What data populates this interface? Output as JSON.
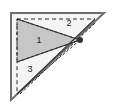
{
  "figure": {
    "name": "right-triangle-subdivision-diagram",
    "canvas": {
      "width": 117,
      "height": 109
    },
    "background_color": "#ffffff",
    "colors": {
      "outline": "#6e6e6e",
      "inner_line": "#3a3a3a",
      "dashed_line": "#2b2b2b",
      "shaded_fill": "#c6c6c6",
      "plain_fill": "#f4f4f4",
      "label_text": "#1a1a1a",
      "vertex_dot": "#333333"
    },
    "outer_triangle": {
      "label": "outer-right-triangle",
      "vertices": [
        {
          "name": "top-left",
          "x": 11,
          "y": 13
        },
        {
          "name": "top-right",
          "x": 104,
          "y": 13
        },
        {
          "name": "bottom-left",
          "x": 11,
          "y": 100
        }
      ],
      "stroke": "#6e6e6e",
      "stroke_width": 2,
      "fill": "#f4f4f4"
    },
    "inner_dashed_triangle": {
      "label": "inner-dashed-triangle",
      "vertices": [
        {
          "name": "top-left",
          "x": 17,
          "y": 19
        },
        {
          "name": "top-right",
          "x": 95,
          "y": 19
        },
        {
          "name": "bottom-left",
          "x": 17,
          "y": 94
        }
      ],
      "stroke": "#2b2b2b",
      "dash": "4 3"
    },
    "shaded_region": {
      "label": "shaded-triangle-region-1",
      "vertices": [
        {
          "name": "apex-left-top",
          "x": 17,
          "y": 19
        },
        {
          "name": "apex-right",
          "x": 80,
          "y": 40
        },
        {
          "name": "apex-left-bottom",
          "x": 17,
          "y": 62
        }
      ],
      "fill": "#c6c6c6",
      "stroke": "#2b2b2b",
      "dash": "3 2"
    },
    "fold_lines": [
      {
        "name": "fold-line-to-vertex-upper",
        "x1": 17,
        "y1": 19,
        "x2": 80,
        "y2": 40,
        "style": "solid"
      },
      {
        "name": "fold-line-to-vertex-lower",
        "x1": 17,
        "y1": 62,
        "x2": 80,
        "y2": 40,
        "style": "solid"
      },
      {
        "name": "fold-line-hypotenuse-inner",
        "x1": 17,
        "y1": 94,
        "x2": 95,
        "y2": 19,
        "style": "solid"
      },
      {
        "name": "fold-line-hypotenuse-dashed",
        "x1": 20,
        "y1": 94,
        "x2": 95,
        "y2": 23,
        "style": "dashed"
      },
      {
        "name": "fold-line-crease-to-vertex",
        "x1": 17,
        "y1": 94,
        "x2": 80,
        "y2": 40,
        "style": "dashed"
      }
    ],
    "vertex_marker": {
      "name": "convergence-vertex-dot",
      "x": 80,
      "y": 40,
      "r": 3
    },
    "labels": [
      {
        "name": "region-label-1",
        "text": "1",
        "x": 39,
        "y": 41
      },
      {
        "name": "region-label-2",
        "text": "2",
        "x": 69,
        "y": 24
      },
      {
        "name": "region-label-3",
        "text": "3",
        "x": 30,
        "y": 70
      }
    ]
  }
}
